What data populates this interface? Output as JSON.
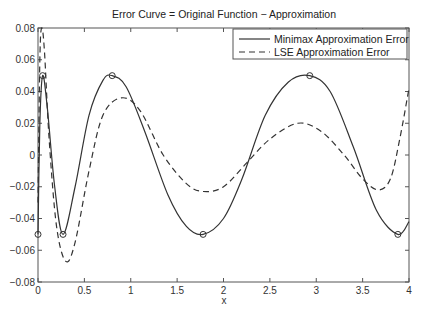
{
  "chart_data": {
    "type": "line",
    "title": "Error Curve = Original Function − Approximation",
    "xlabel": "x",
    "ylabel": "",
    "xlim": [
      0,
      4
    ],
    "ylim": [
      -0.08,
      0.08
    ],
    "grid": false,
    "legend_position": "upper right",
    "x_ticks": [
      "0",
      "0.5",
      "1",
      "1.5",
      "2",
      "2.5",
      "3",
      "3.5",
      "4"
    ],
    "y_ticks": [
      "0.08",
      "0.06",
      "0.04",
      "0.02",
      "0",
      "-0.02",
      "-0.04",
      "-0.06",
      "-0.08"
    ],
    "series": [
      {
        "name": "Minimax Approximation Error",
        "style": "solid",
        "x": [
          0,
          0.02,
          0.05,
          0.1,
          0.18,
          0.27,
          0.4,
          0.55,
          0.7,
          0.8,
          0.95,
          1.15,
          1.4,
          1.6,
          1.78,
          2.0,
          2.2,
          2.45,
          2.7,
          2.93,
          3.15,
          3.4,
          3.65,
          3.88,
          4.0
        ],
        "values": [
          -0.05,
          0.02,
          0.05,
          0.03,
          -0.02,
          -0.05,
          -0.02,
          0.025,
          0.047,
          0.05,
          0.043,
          0.015,
          -0.025,
          -0.045,
          -0.05,
          -0.04,
          -0.015,
          0.025,
          0.046,
          0.05,
          0.04,
          0.005,
          -0.035,
          -0.05,
          -0.042
        ]
      },
      {
        "name": "LSE Approximation Error",
        "style": "dashed",
        "x": [
          0,
          0.02,
          0.04,
          0.07,
          0.12,
          0.2,
          0.3,
          0.4,
          0.55,
          0.7,
          0.9,
          1.1,
          1.35,
          1.6,
          1.78,
          2.0,
          2.25,
          2.5,
          2.8,
          3.05,
          3.3,
          3.5,
          3.67,
          3.8,
          3.9,
          4.0
        ],
        "values": [
          -0.03,
          0.06,
          0.08,
          0.065,
          0.01,
          -0.045,
          -0.067,
          -0.055,
          -0.01,
          0.025,
          0.036,
          0.028,
          0.0,
          -0.018,
          -0.023,
          -0.02,
          -0.005,
          0.01,
          0.02,
          0.015,
          0.0,
          -0.015,
          -0.022,
          -0.015,
          0.01,
          0.042
        ]
      }
    ],
    "markers": {
      "series": "Minimax Approximation Error",
      "shape": "circle",
      "points": [
        [
          0,
          -0.05
        ],
        [
          0.05,
          0.05
        ],
        [
          0.27,
          -0.05
        ],
        [
          0.8,
          0.05
        ],
        [
          1.78,
          -0.05
        ],
        [
          2.93,
          0.05
        ],
        [
          3.88,
          -0.05
        ]
      ]
    }
  },
  "colors": {
    "line": "#333333",
    "axes": "#555555",
    "background": "#ffffff"
  }
}
